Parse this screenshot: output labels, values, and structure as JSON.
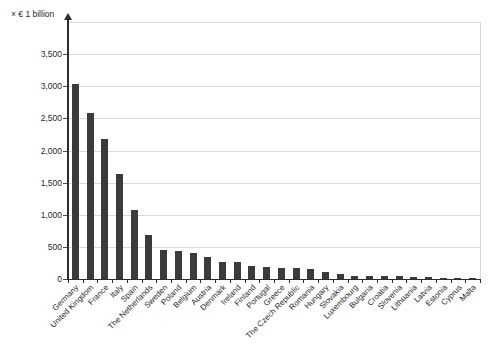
{
  "chart_data": {
    "type": "bar",
    "title": "",
    "unit_label": "× € 1 billion",
    "xlabel": "",
    "ylabel": "× € 1 billion",
    "categories": [
      "Germany",
      "United Kingdom",
      "France",
      "Italy",
      "Spain",
      "The Netherlands",
      "Sweden",
      "Poland",
      "Belgium",
      "Austria",
      "Denmark",
      "Ireland",
      "Finland",
      "Portugal",
      "Greece",
      "The Czech Republic",
      "Romania",
      "Hungary",
      "Slovakia",
      "Luxembourg",
      "Bulgaria",
      "Croatia",
      "Slovenia",
      "Lithuania",
      "Latvia",
      "Estonia",
      "Cyprus",
      "Malta"
    ],
    "values": [
      3030,
      2580,
      2180,
      1640,
      1080,
      680,
      450,
      430,
      410,
      340,
      270,
      260,
      210,
      180,
      176,
      168,
      160,
      110,
      79,
      51,
      45,
      44,
      39,
      37,
      24,
      20,
      18,
      9
    ],
    "ylim": [
      0,
      4000
    ],
    "yticks": [
      0,
      500,
      1000,
      1500,
      2000,
      2500,
      3000,
      3500
    ],
    "ytick_labels": [
      "0",
      "500",
      "1,000",
      "1,500",
      "2,000",
      "2,500",
      "3,000",
      "3,500"
    ],
    "grid": true,
    "legend": false,
    "x_label_rotation_deg": 45,
    "colors": {
      "bar": "#3b3b3b",
      "grid": "#d9d9d9",
      "axis": "#2e2e2e",
      "text": "#1f1f1f",
      "background": "#ffffff"
    }
  }
}
